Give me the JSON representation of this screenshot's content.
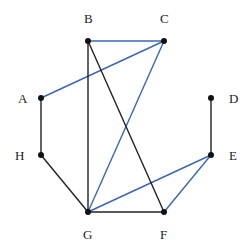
{
  "diagram": {
    "type": "graph",
    "nodes": [
      {
        "id": "A",
        "label": "A",
        "x": 41,
        "y": 98,
        "lx": 18,
        "ly": 103
      },
      {
        "id": "B",
        "label": "B",
        "x": 88,
        "y": 41,
        "lx": 84,
        "ly": 23
      },
      {
        "id": "C",
        "label": "C",
        "x": 164,
        "y": 41,
        "lx": 160,
        "ly": 23
      },
      {
        "id": "D",
        "label": "D",
        "x": 211,
        "y": 98,
        "lx": 229,
        "ly": 103
      },
      {
        "id": "E",
        "label": "E",
        "x": 211,
        "y": 155,
        "lx": 229,
        "ly": 160
      },
      {
        "id": "F",
        "label": "F",
        "x": 164,
        "y": 212,
        "lx": 160,
        "ly": 239
      },
      {
        "id": "G",
        "label": "G",
        "x": 88,
        "y": 212,
        "lx": 83,
        "ly": 239
      },
      {
        "id": "H",
        "label": "H",
        "x": 41,
        "y": 155,
        "lx": 15,
        "ly": 160
      }
    ],
    "edges": [
      {
        "from": "B",
        "to": "C",
        "color": "#3a66b4"
      },
      {
        "from": "A",
        "to": "C",
        "color": "#3a66b4"
      },
      {
        "from": "C",
        "to": "G",
        "color": "#3a66b4"
      },
      {
        "from": "G",
        "to": "E",
        "color": "#3a66b4"
      },
      {
        "from": "E",
        "to": "F",
        "color": "#3a66b4"
      },
      {
        "from": "B",
        "to": "G",
        "color": "#222222"
      },
      {
        "from": "B",
        "to": "F",
        "color": "#222222"
      },
      {
        "from": "A",
        "to": "H",
        "color": "#222222"
      },
      {
        "from": "H",
        "to": "G",
        "color": "#222222"
      },
      {
        "from": "G",
        "to": "F",
        "color": "#222222"
      },
      {
        "from": "D",
        "to": "E",
        "color": "#222222"
      }
    ],
    "colors": {
      "blue_edge": "#3a66b4",
      "black_edge": "#222222",
      "node": "#111111"
    }
  }
}
